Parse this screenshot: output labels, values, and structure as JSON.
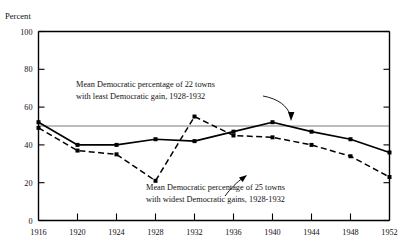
{
  "chart_data": {
    "type": "line",
    "title": "",
    "xlabel": "",
    "ylabel": "Percent",
    "ylim": [
      0,
      100
    ],
    "xlim": [
      1916,
      1952
    ],
    "grid": false,
    "legend_position": "annotations-inline",
    "yticks": [
      "0",
      "20",
      "40",
      "60",
      "80",
      "100"
    ],
    "ytick_values": [
      0,
      20,
      40,
      60,
      80,
      100
    ],
    "x": [
      1916,
      1920,
      1924,
      1928,
      1932,
      1936,
      1940,
      1944,
      1948,
      1952
    ],
    "xticks": [
      "1916",
      "1920",
      "1924",
      "1928",
      "1932",
      "1936",
      "1940",
      "1944",
      "1948",
      "1952"
    ],
    "series": [
      {
        "name": "Mean Democratic percentage of 22 towns with least Democratic gain, 1928-1932",
        "style": "solid",
        "values": [
          52,
          40,
          40,
          43,
          42,
          47,
          52,
          47,
          43,
          36
        ]
      },
      {
        "name": "Mean Democratic percentage of 25 towns with widest Democratic gains, 1928-1932",
        "style": "dashed",
        "values": [
          49,
          37,
          35,
          21,
          55,
          45,
          44,
          40,
          34,
          23
        ]
      }
    ],
    "reference_line": {
      "value": 50,
      "orientation": "horizontal",
      "style": "thin-solid"
    },
    "annotations": [
      {
        "id": "annotation-least-gain",
        "line1": "Mean Democratic percentage of  22 towns",
        "line2": "with least Democratic gain, 1928-1932",
        "points_to_year": 1940,
        "points_to_value": 52
      },
      {
        "id": "annotation-widest-gains",
        "line1": "Mean Democratic percentage of  25 towns",
        "line2": "with widest Democratic gains,  1928-1932",
        "points_to_year": 1948,
        "points_to_value": 34
      }
    ]
  },
  "axes": {
    "y_title": "Percent"
  }
}
